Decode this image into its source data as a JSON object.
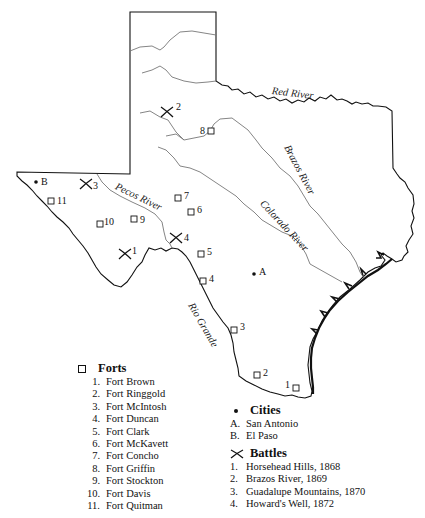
{
  "map": {
    "rivers": [
      {
        "name": "Red River",
        "label": "Red River"
      },
      {
        "name": "Brazos River",
        "label": "Brazos River"
      },
      {
        "name": "Colorado River",
        "label": "Colorado River"
      },
      {
        "name": "Pecos River",
        "label": "Pecos River"
      },
      {
        "name": "Rio Grande",
        "label": "Rio Grande"
      }
    ],
    "fort_markers": [
      {
        "id": "1",
        "x": 296,
        "y": 388
      },
      {
        "id": "2",
        "x": 257,
        "y": 375
      },
      {
        "id": "3",
        "x": 234,
        "y": 330
      },
      {
        "id": "4",
        "x": 203,
        "y": 281
      },
      {
        "id": "5",
        "x": 201,
        "y": 254
      },
      {
        "id": "6",
        "x": 191,
        "y": 212
      },
      {
        "id": "7",
        "x": 178,
        "y": 198
      },
      {
        "id": "8",
        "x": 211,
        "y": 131
      },
      {
        "id": "9",
        "x": 134,
        "y": 219
      },
      {
        "id": "10",
        "x": 100,
        "y": 224
      },
      {
        "id": "11",
        "x": 51,
        "y": 201
      }
    ],
    "city_markers": [
      {
        "id": "A",
        "x": 254,
        "y": 274
      },
      {
        "id": "B",
        "x": 36,
        "y": 182
      }
    ],
    "battle_markers": [
      {
        "id": "1",
        "x": 125,
        "y": 254
      },
      {
        "id": "2",
        "x": 167,
        "y": 112
      },
      {
        "id": "3",
        "x": 86,
        "y": 184
      },
      {
        "id": "4",
        "x": 176,
        "y": 238
      }
    ]
  },
  "legend": {
    "forts": {
      "title": "Forts",
      "items": [
        {
          "num": "1.",
          "name": "Fort Brown"
        },
        {
          "num": "2.",
          "name": "Fort Ringgold"
        },
        {
          "num": "3.",
          "name": "Fort McIntosh"
        },
        {
          "num": "4.",
          "name": "Fort Duncan"
        },
        {
          "num": "5.",
          "name": "Fort Clark"
        },
        {
          "num": "6.",
          "name": "Fort McKavett"
        },
        {
          "num": "7.",
          "name": "Fort Concho"
        },
        {
          "num": "8.",
          "name": "Fort Griffin"
        },
        {
          "num": "9.",
          "name": "Fort Stockton"
        },
        {
          "num": "10.",
          "name": "Fort Davis"
        },
        {
          "num": "11.",
          "name": "Fort Quitman"
        }
      ]
    },
    "cities": {
      "title": "Cities",
      "items": [
        {
          "num": "A.",
          "name": "San Antonio"
        },
        {
          "num": "B.",
          "name": "El Paso"
        }
      ]
    },
    "battles": {
      "title": "Battles",
      "items": [
        {
          "num": "1.",
          "name": "Horsehead Hills, 1868"
        },
        {
          "num": "2.",
          "name": "Brazos River, 1869"
        },
        {
          "num": "3.",
          "name": "Guadalupe Mountains, 1870"
        },
        {
          "num": "4.",
          "name": "Howard's Well, 1872"
        }
      ]
    }
  }
}
